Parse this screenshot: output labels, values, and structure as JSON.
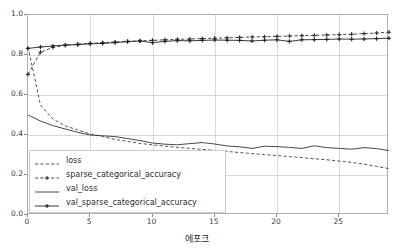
{
  "chart_data": {
    "type": "line",
    "title": "",
    "xlabel": "에포크",
    "ylabel": "",
    "xlim": [
      0,
      29
    ],
    "ylim": [
      0.0,
      1.0
    ],
    "grid": true,
    "legend_position": "lower left",
    "xticks": [
      "0",
      "5",
      "10",
      "15",
      "20",
      "25"
    ],
    "xtick_values": [
      0,
      5,
      10,
      15,
      20,
      25
    ],
    "yticks": [
      "0.0",
      "0.2",
      "0.4",
      "0.6",
      "0.8",
      "1.0"
    ],
    "ytick_values": [
      0.0,
      0.2,
      0.4,
      0.6,
      0.8,
      1.0
    ],
    "x": [
      0,
      1,
      2,
      3,
      4,
      5,
      6,
      7,
      8,
      9,
      10,
      11,
      12,
      13,
      14,
      15,
      16,
      17,
      18,
      19,
      20,
      21,
      22,
      23,
      24,
      25,
      26,
      27,
      28,
      29
    ],
    "series": [
      {
        "name": "loss",
        "style": "dashed",
        "marker": "none",
        "color": "#444444",
        "values": [
          0.84,
          0.55,
          0.48,
          0.445,
          0.425,
          0.405,
          0.392,
          0.378,
          0.368,
          0.358,
          0.351,
          0.344,
          0.338,
          0.333,
          0.328,
          0.323,
          0.318,
          0.312,
          0.307,
          0.302,
          0.297,
          0.292,
          0.287,
          0.281,
          0.276,
          0.27,
          0.263,
          0.254,
          0.243,
          0.232
        ]
      },
      {
        "name": "sparse_categorical_accuracy",
        "style": "dashed",
        "marker": "plus",
        "color": "#333333",
        "values": [
          0.703,
          0.814,
          0.838,
          0.848,
          0.854,
          0.858,
          0.862,
          0.865,
          0.868,
          0.871,
          0.873,
          0.876,
          0.878,
          0.88,
          0.882,
          0.884,
          0.886,
          0.888,
          0.89,
          0.891,
          0.893,
          0.895,
          0.897,
          0.898,
          0.9,
          0.902,
          0.904,
          0.907,
          0.91,
          0.914
        ]
      },
      {
        "name": "val_loss",
        "style": "solid",
        "marker": "none",
        "color": "#333333",
        "values": [
          0.5,
          0.47,
          0.447,
          0.43,
          0.413,
          0.4,
          0.396,
          0.392,
          0.382,
          0.372,
          0.36,
          0.354,
          0.351,
          0.357,
          0.362,
          0.355,
          0.345,
          0.341,
          0.333,
          0.344,
          0.342,
          0.338,
          0.333,
          0.346,
          0.337,
          0.333,
          0.329,
          0.337,
          0.332,
          0.322
        ]
      },
      {
        "name": "val_sparse_categorical_accuracy",
        "style": "solid",
        "marker": "plus",
        "color": "#222222",
        "values": [
          0.833,
          0.84,
          0.845,
          0.85,
          0.852,
          0.856,
          0.858,
          0.862,
          0.867,
          0.87,
          0.862,
          0.868,
          0.872,
          0.871,
          0.873,
          0.875,
          0.874,
          0.873,
          0.87,
          0.874,
          0.876,
          0.868,
          0.876,
          0.877,
          0.878,
          0.88,
          0.879,
          0.88,
          0.882,
          0.884
        ]
      }
    ]
  },
  "legend": {
    "items": [
      {
        "label": "loss"
      },
      {
        "label": "sparse_categorical_accuracy"
      },
      {
        "label": "val_loss"
      },
      {
        "label": "val_sparse_categorical_accuracy"
      }
    ]
  }
}
